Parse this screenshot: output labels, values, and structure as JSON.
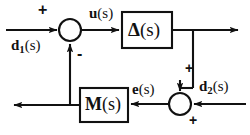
{
  "diagram": {
    "type": "control-block-diagram",
    "background_color": "#ffffff",
    "line_color": "#111111",
    "blocks": [
      {
        "id": "delta",
        "symbol": "Δ",
        "arg": "(s)",
        "label": "Δ(s)",
        "x": 122,
        "y": 12,
        "width": 50,
        "height": 36
      },
      {
        "id": "m",
        "symbol": "M",
        "arg": "(s)",
        "label": "M(s)",
        "x": 80,
        "y": 88,
        "width": 48,
        "height": 34
      }
    ],
    "junctions": [
      {
        "id": "sum-left",
        "cx": 70,
        "cy": 30,
        "r": 11
      },
      {
        "id": "sum-right",
        "cx": 180,
        "cy": 104,
        "r": 11
      }
    ],
    "signals": {
      "u": {
        "var": "u",
        "sub": "",
        "arg": "(s)"
      },
      "e": {
        "var": "e",
        "sub": "",
        "arg": "(s)"
      },
      "d1": {
        "var": "d",
        "sub": "1",
        "arg": "(s)"
      },
      "d2": {
        "var": "d",
        "sub": "2",
        "arg": "(s)"
      }
    },
    "signs": {
      "d1_input": "+",
      "feedback_input": "-",
      "delta_into_sum": "+",
      "d2_input": "+"
    }
  }
}
